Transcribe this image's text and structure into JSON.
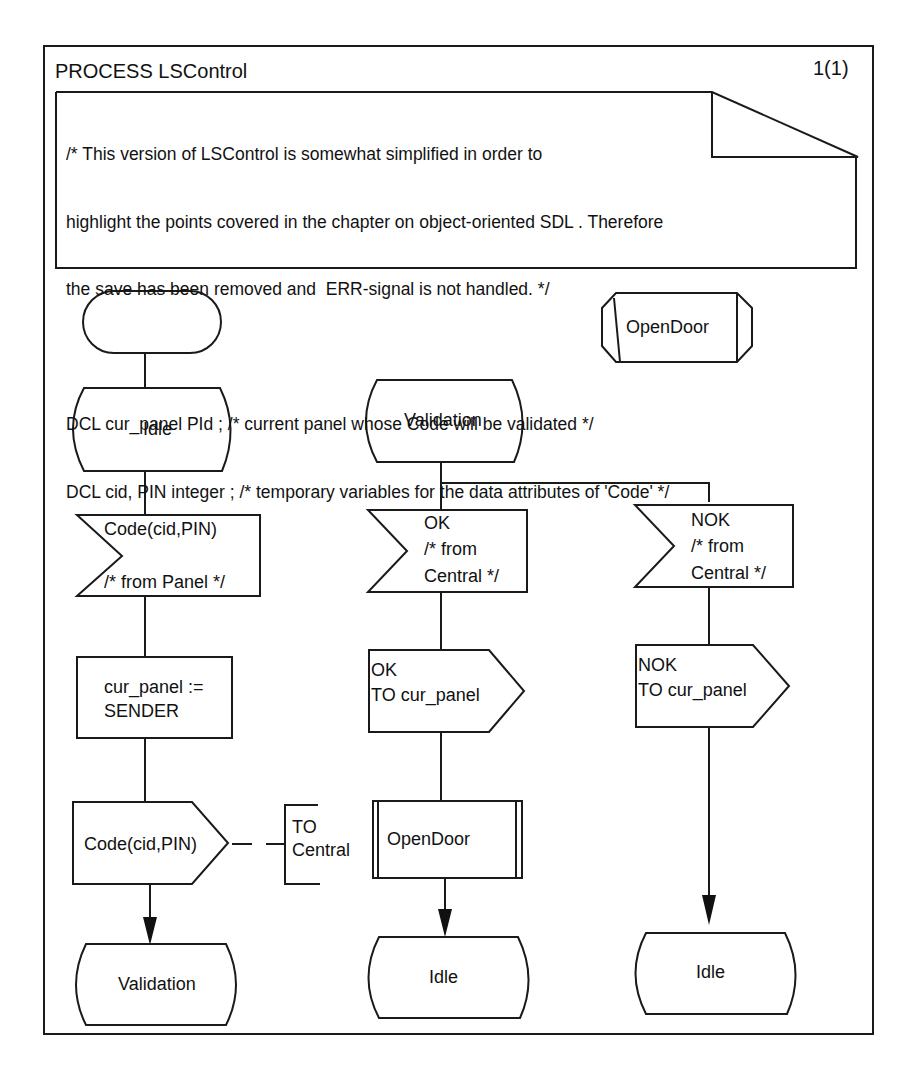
{
  "diagram": {
    "type": "SDL process diagram",
    "title": "PROCESS LSControl",
    "page_number": "1(1)",
    "text_symbol": {
      "lines": [
        "/* This version of LSControl is somewhat simplified in order to",
        "highlight the points covered in the chapter on object-oriented SDL . Therefore",
        "the save has been removed and  ERR-signal is not handled. */",
        "",
        "DCL cur_panel PId ; /* current panel whose Code will be validated */",
        "DCL cid, PIN integer ; /* temporary variables for the data attributes of 'Code' */"
      ]
    },
    "procedure_reference": {
      "label": "OpenDoor"
    },
    "left_column": {
      "start": {
        "label": ""
      },
      "state_idle": {
        "label": "Idle"
      },
      "input_code": {
        "line1": "Code(cid,PIN)",
        "line2": "/* from Panel */"
      },
      "task": {
        "line1": "cur_panel :=",
        "line2": "SENDER"
      },
      "output_code": {
        "label": "Code(cid,PIN)"
      },
      "output_comment": {
        "line1": "TO",
        "line2": "Central"
      },
      "nextstate": {
        "label": "Validation"
      }
    },
    "middle_column": {
      "state_validation": {
        "label": "Validation"
      },
      "input_ok": {
        "line1": "OK",
        "line2": "/* from",
        "line3": "Central */"
      },
      "output_ok": {
        "line1": "OK",
        "line2": "TO cur_panel"
      },
      "procedure_call": {
        "label": "OpenDoor"
      },
      "nextstate": {
        "label": "Idle"
      }
    },
    "right_column": {
      "input_nok": {
        "line1": "NOK",
        "line2": "/* from",
        "line3": "Central */"
      },
      "output_nok": {
        "line1": "NOK",
        "line2": "TO cur_panel"
      },
      "nextstate": {
        "label": "Idle"
      }
    }
  }
}
